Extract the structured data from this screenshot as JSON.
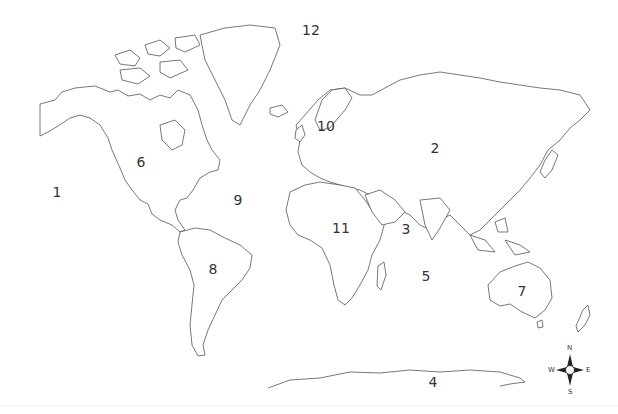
{
  "map": {
    "type": "world-outline-map",
    "background": "#ffffff",
    "outline_color": "#555555",
    "labels": [
      {
        "id": "1",
        "text": "1",
        "x": 57,
        "y": 192
      },
      {
        "id": "2",
        "text": "2",
        "x": 435,
        "y": 148
      },
      {
        "id": "3",
        "text": "3",
        "x": 406,
        "y": 229
      },
      {
        "id": "4",
        "text": "4",
        "x": 433,
        "y": 382
      },
      {
        "id": "5",
        "text": "5",
        "x": 426,
        "y": 276
      },
      {
        "id": "6",
        "text": "6",
        "x": 141,
        "y": 162
      },
      {
        "id": "7",
        "text": "7",
        "x": 522,
        "y": 291
      },
      {
        "id": "8",
        "text": "8",
        "x": 213,
        "y": 269
      },
      {
        "id": "9",
        "text": "9",
        "x": 238,
        "y": 200
      },
      {
        "id": "10",
        "text": "10",
        "x": 326,
        "y": 126
      },
      {
        "id": "11",
        "text": "11",
        "x": 341,
        "y": 228
      },
      {
        "id": "12",
        "text": "12",
        "x": 311,
        "y": 30
      }
    ],
    "compass": {
      "north": "N",
      "south": "S",
      "east": "E",
      "west": "W"
    }
  }
}
